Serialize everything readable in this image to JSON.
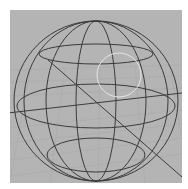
{
  "viewport": {
    "background_color": "#b4b4b4",
    "grid_color": "#a9a9a9",
    "wire_color": "#3a3a3a",
    "highlight_color": "#e6e6e6",
    "axis_color": "#3c3c3c"
  },
  "scene": {
    "object": "wireframe-sphere",
    "center": [
      96,
      101
    ],
    "radius_x": 82,
    "radius_y": 80,
    "latitudes": [
      {
        "cx": 96,
        "cy": 54,
        "rx": 58,
        "ry": 11
      },
      {
        "cx": 96,
        "cy": 106,
        "rx": 79,
        "ry": 22
      },
      {
        "cx": 96,
        "cy": 155,
        "rx": 49,
        "ry": 18
      }
    ],
    "meridians": [
      {
        "cx": 96,
        "rx": 20
      },
      {
        "cx": 96,
        "rx": 50
      },
      {
        "cx": 96,
        "rx": 74
      }
    ],
    "selection_circle": {
      "cx": 119,
      "cy": 75,
      "r": 22
    },
    "axes": [
      {
        "x1": 0,
        "y1": 103,
        "x2": 172,
        "y2": 83
      },
      {
        "x1": 38,
        "y1": 50,
        "x2": 172,
        "y2": 167
      }
    ]
  }
}
